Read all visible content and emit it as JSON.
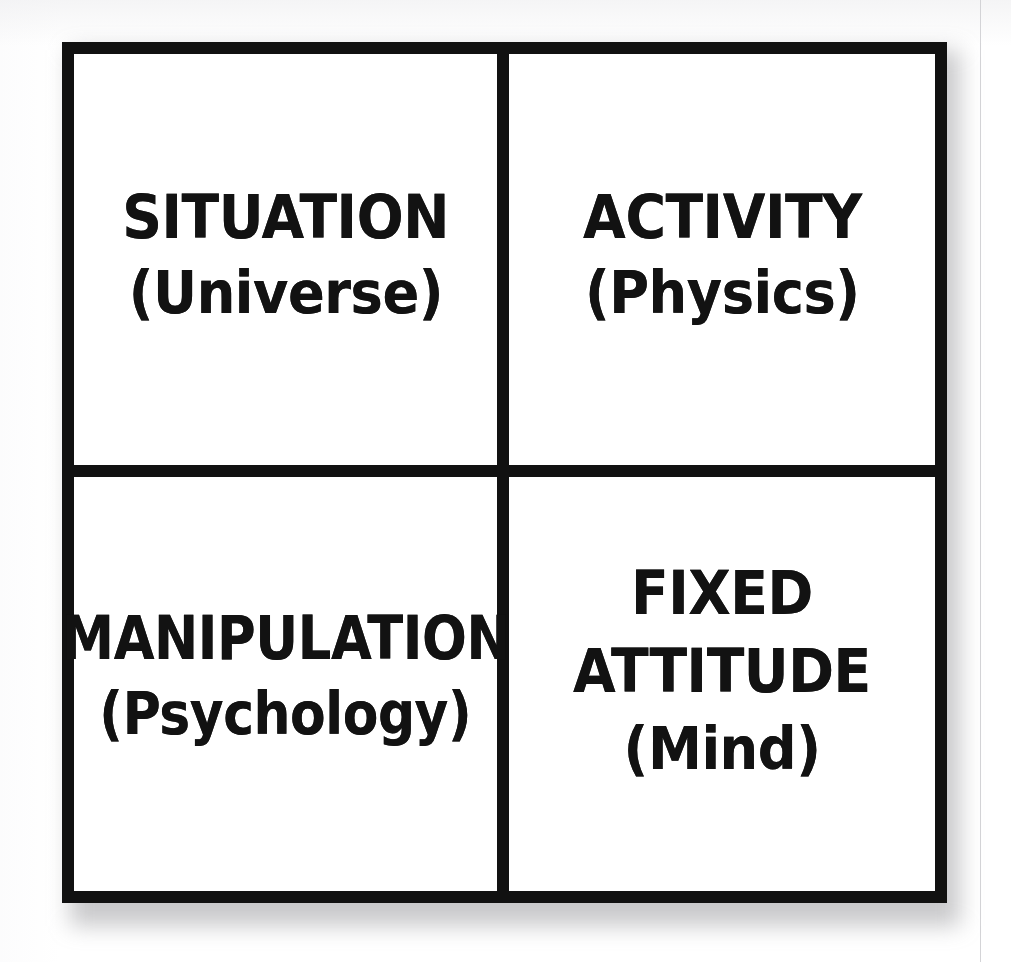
{
  "diagram": {
    "type": "2x2-quadrant-matrix",
    "rows": 2,
    "columns": 2,
    "border_color": "#111111",
    "background_color": "#ffffff",
    "text_color": "#121212",
    "quadrants": [
      {
        "position": "top-left",
        "primary": "SITUATION",
        "secondary": "(Universe)",
        "lines": [
          "SITUATION",
          "(Universe)"
        ]
      },
      {
        "position": "top-right",
        "primary": "ACTIVITY",
        "secondary": "(Physics)",
        "lines": [
          "ACTIVITY",
          "(Physics)"
        ]
      },
      {
        "position": "bottom-left",
        "primary": "MANIPULATION",
        "secondary": "(Psychology)",
        "lines": [
          "MANIPULATION",
          "(Psychology)"
        ]
      },
      {
        "position": "bottom-right",
        "primary": "FIXED",
        "primary_line_two": "ATTITUDE",
        "secondary": "(Mind)",
        "lines": [
          "FIXED",
          "ATTITUDE",
          "(Mind)"
        ]
      }
    ]
  }
}
